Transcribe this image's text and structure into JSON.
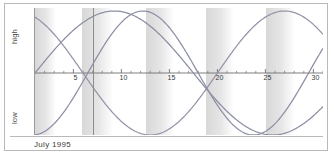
{
  "chart_data": {
    "type": "line",
    "title": "",
    "subtitle": "",
    "xlabel": "",
    "ylabel": "",
    "caption": "July 1995",
    "axis_labels": {
      "top": "high",
      "bottom": "low"
    },
    "xlim": [
      1,
      31
    ],
    "ylim": [
      -1,
      1
    ],
    "grid": false,
    "legend": "none",
    "zero_line": true,
    "x_tick_labels": [
      "5",
      "10",
      "15",
      "20",
      "25",
      "30"
    ],
    "x_tick_values": [
      5,
      10,
      15,
      20,
      25,
      30
    ],
    "x_minor_ticks_every": 1,
    "marker_line_x": 7,
    "shaded_bands": [
      {
        "start": 1.0,
        "end": 4.0
      },
      {
        "start": 5.9,
        "end": 10.4
      },
      {
        "start": 12.6,
        "end": 16.6
      },
      {
        "start": 18.8,
        "end": 22.9
      },
      {
        "start": 25.1,
        "end": 29.2
      }
    ],
    "series": [
      {
        "name": "physical",
        "period_days": 23,
        "phase_day": 6.5,
        "amplitude": 1.0,
        "color": "#8d8fa6"
      },
      {
        "name": "emotional",
        "period_days": 28,
        "phase_day": 20.0,
        "amplitude": 1.0,
        "color": "#9a93a8"
      },
      {
        "name": "intellectual",
        "period_days": 33,
        "phase_day": 1.0,
        "amplitude": 1.0,
        "color": "#8b8fa2"
      }
    ]
  },
  "colors": {
    "frame_border": "#b9b9b9",
    "axis": "#6f6f6f",
    "band_light": "#ffffff",
    "band_dark": "#d8d8d8",
    "text": "#3d3d3d"
  }
}
